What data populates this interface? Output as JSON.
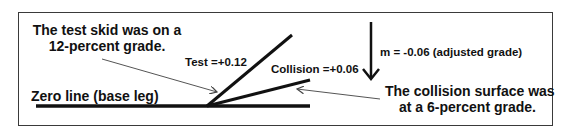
{
  "diagram": {
    "test_note": [
      "The test skid was on a",
      "12-percent grade."
    ],
    "test_label": "Test =+0.12",
    "collision_label": "Collision =+0.06",
    "slope_label": "m = -0.06 (adjusted grade)",
    "zero_line_label": "Zero line (base leg)",
    "collision_note": [
      "The collision surface was",
      "at a 6-percent grade."
    ],
    "colors": {
      "line": "#111111",
      "pointer": "#555555",
      "border": "#3a3a3a"
    },
    "values": {
      "test_grade": 0.12,
      "collision_grade": 0.06,
      "adjusted_grade": -0.06
    }
  }
}
